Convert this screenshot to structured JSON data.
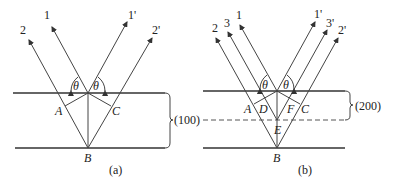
{
  "panels": [
    {
      "id": "a",
      "caption": "(a)",
      "plane_label": "(100)",
      "rays_in": [
        "1",
        "2"
      ],
      "rays_out": [
        "1'",
        "2'"
      ],
      "angle_label": "θ",
      "points": [
        "A",
        "B",
        "C"
      ]
    },
    {
      "id": "b",
      "caption": "(b)",
      "plane_label": "(200)",
      "left_plane_label": "(100)",
      "rays_in": [
        "2",
        "3",
        "1"
      ],
      "rays_out": [
        "1'",
        "3'",
        "2'"
      ],
      "angle_label": "θ",
      "points": [
        "A",
        "D",
        "F",
        "C",
        "E",
        "B"
      ]
    }
  ],
  "colors": {
    "line": "#444444",
    "text": "#222222",
    "background": "#ffffff"
  }
}
